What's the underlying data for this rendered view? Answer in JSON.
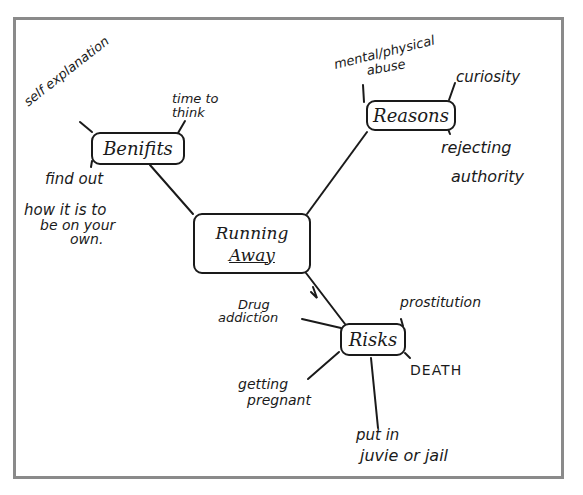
{
  "diagram": {
    "type": "mind-map",
    "style": "hand-drawn",
    "center": {
      "label_line1": "Running",
      "label_line2": "Away"
    },
    "branches": {
      "benefits": {
        "label": "Benifits",
        "items": [
          "self explanation",
          "time to think",
          "find out",
          "how it is to",
          "be on your",
          "own."
        ]
      },
      "reasons": {
        "label": "Reasons",
        "items": [
          "mental/physical",
          "abuse",
          "curiosity",
          "rejecting",
          "authority"
        ]
      },
      "risks": {
        "label": "Risks",
        "items": [
          "Drug",
          "addiction",
          "prostitution",
          "DEATH",
          "getting",
          "pregnant",
          "put in",
          "juvie or jail"
        ]
      }
    }
  },
  "colors": {
    "ink": "#1a1a1a",
    "frame": "#8a8a8a",
    "paper": "#ffffff"
  }
}
